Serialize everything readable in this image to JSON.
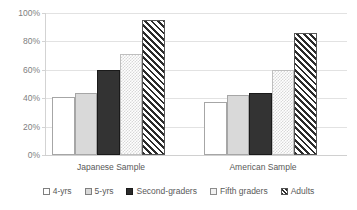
{
  "chart_data": {
    "type": "bar",
    "title": "",
    "subtitle": "",
    "xlabel": "",
    "ylabel": "",
    "ylim": [
      0,
      100
    ],
    "ytick_labels": [
      "0%",
      "20%",
      "40%",
      "60%",
      "80%",
      "100%"
    ],
    "ytick_values": [
      0,
      20,
      40,
      60,
      80,
      100
    ],
    "grid": true,
    "grid_axis": "y",
    "legend_position": "bottom",
    "categories": [
      "Japanese Sample",
      "American Sample"
    ],
    "series": [
      {
        "name": "4-yrs",
        "values": [
          41,
          37
        ],
        "fill": "white",
        "color": "#ffffff"
      },
      {
        "name": "5-yrs",
        "values": [
          44,
          42
        ],
        "fill": "light-gray",
        "color": "#d9d9d9"
      },
      {
        "name": "Second-graders",
        "values": [
          60,
          44
        ],
        "fill": "dark",
        "color": "#333333"
      },
      {
        "name": "Fifth graders",
        "values": [
          71,
          60
        ],
        "fill": "fine-checker",
        "color": "#f2f2f2"
      },
      {
        "name": "Adults",
        "values": [
          95,
          86
        ],
        "fill": "diagonal-hatch",
        "color": "#2b2b2b"
      }
    ]
  },
  "legend": {
    "items": [
      {
        "label": "4-yrs"
      },
      {
        "label": "5-yrs"
      },
      {
        "label": "Second-graders"
      },
      {
        "label": "Fifth graders"
      },
      {
        "label": "Adults"
      }
    ]
  },
  "axis": {
    "y_ticks": [
      {
        "label": "100%"
      },
      {
        "label": "80%"
      },
      {
        "label": "60%"
      },
      {
        "label": "40%"
      },
      {
        "label": "20%"
      },
      {
        "label": "0%"
      }
    ]
  },
  "colors": {
    "gridline": "#e2e2e2",
    "axis": "#d3d3d3",
    "text": "#595959",
    "tick_text": "#808080",
    "background": "#ffffff"
  }
}
